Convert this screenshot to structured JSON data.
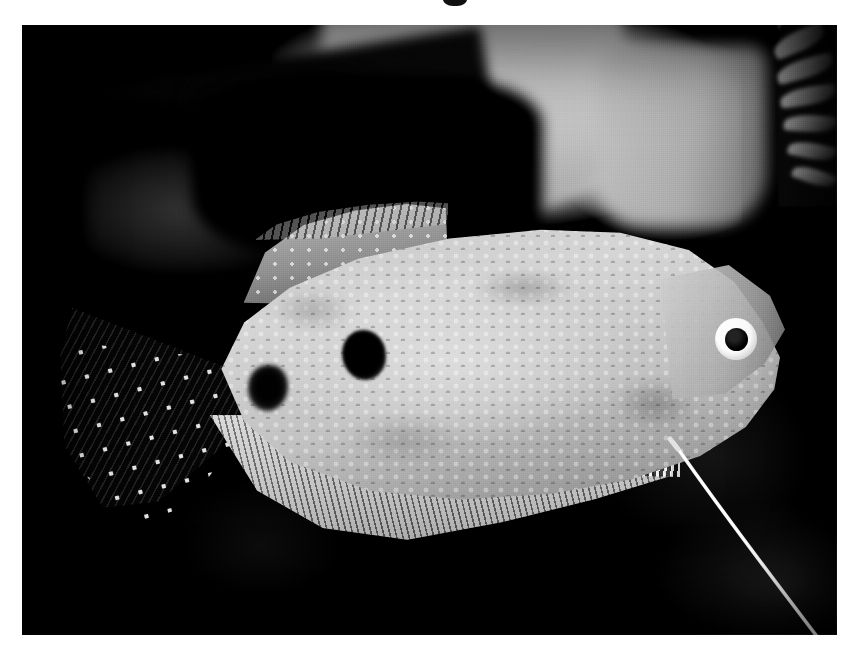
{
  "page": {
    "kind": "photograph",
    "background_color": "#ffffff",
    "width": 862,
    "height": 656
  },
  "cropped_text_artifact": {
    "name": "cropped-heading-descender",
    "note": "bottom sliver of a black text glyph cut off at the top edge",
    "color": "#111111",
    "x": 455,
    "y": 0
  },
  "photo": {
    "frame": {
      "x": 22,
      "y": 25,
      "width": 815,
      "height": 610
    },
    "palette": {
      "paper_white": "#ffffff",
      "deep_black": "#070707",
      "background_dark": "#0d0d0d",
      "background_light_rock": "#c4c4c4",
      "body_highlight": "#d6d6d6",
      "body_midtone": "#b0b0b0",
      "body_shadow": "#7c7c7c",
      "fin_dark": "#111111",
      "fin_spot_white": "#f5f5f5",
      "spot_black": "#050505",
      "eye_white": "#f4f4f4",
      "eye_pupil": "#050505",
      "filament_white": "#e8e8e8"
    },
    "subject": {
      "common_name": "Three Spot Gourami",
      "orientation": "facing right",
      "caption": ""
    },
    "background_elements": [
      {
        "name": "dark-rock-upper-left",
        "tone": "black",
        "x": 0,
        "y": 40,
        "width": 500,
        "height": 240
      },
      {
        "name": "light-grey-backdrop",
        "tone": "light grey",
        "x": 250,
        "y": 0,
        "width": 470,
        "height": 230
      },
      {
        "name": "grey-band-right-of-centre",
        "tone": "mid grey",
        "x": 575,
        "y": 20,
        "width": 170,
        "height": 180
      },
      {
        "name": "plant-leaves-upper-right",
        "tone": "mid grey on black",
        "x": 756,
        "y": 0,
        "width": 70,
        "height": 190
      },
      {
        "name": "dark-substrate-lower",
        "tone": "near black",
        "x": 0,
        "y": 360,
        "width": 815,
        "height": 250
      }
    ],
    "fish_parts": [
      {
        "name": "caudal-fin",
        "label": "Caudal fin (forked, dark with rows of white spots)",
        "x": 38,
        "y": 270,
        "width": 215,
        "height": 215
      },
      {
        "name": "dorsal-fin",
        "label": "Dorsal fin (serrated upper margin, spotted)",
        "x": 213,
        "y": 177,
        "width": 215,
        "height": 105
      },
      {
        "name": "body",
        "label": "Body (mottled silver-grey scales)",
        "x": 188,
        "y": 199,
        "width": 570,
        "height": 290
      },
      {
        "name": "head",
        "label": "Head and snout",
        "x": 638,
        "y": 240,
        "width": 125,
        "height": 140
      },
      {
        "name": "eye",
        "label": "Eye (dark pupil, pale ring)",
        "x": 707,
        "y": 314
      },
      {
        "name": "spot-mid-body",
        "label": "Mid-body dark spot",
        "x": 450,
        "y": 350
      },
      {
        "name": "spot-caudal-peduncle",
        "label": "Caudal peduncle dark spot",
        "x": 238,
        "y": 372
      },
      {
        "name": "anal-fin",
        "label": "Anal fin (long, finely rayed)",
        "x": 188,
        "y": 390,
        "width": 470,
        "height": 145
      },
      {
        "name": "pelvic-filament",
        "label": "Thread-like pelvic filament",
        "from_x": 616,
        "from_y": 420,
        "to_x": 800,
        "to_y": 634
      }
    ]
  }
}
